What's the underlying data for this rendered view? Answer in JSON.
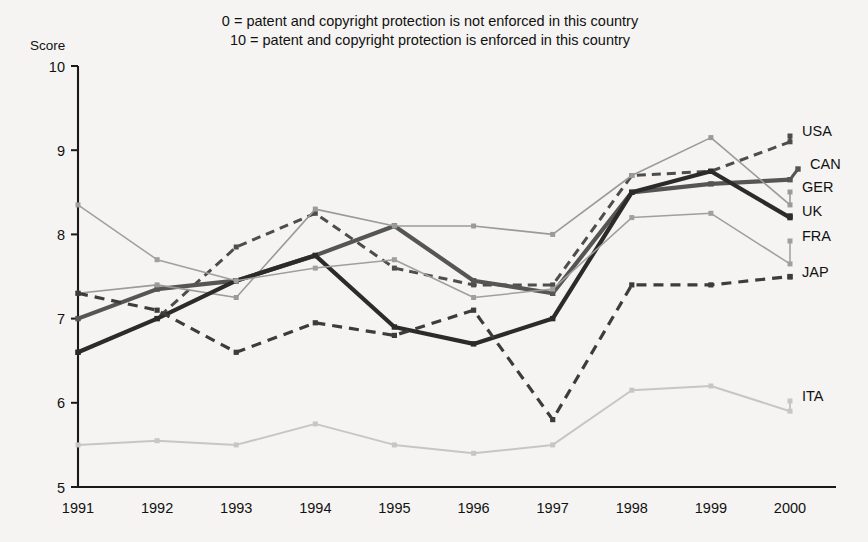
{
  "chart_data": {
    "type": "line",
    "title": "",
    "subtitle_lines": [
      "0 = patent and copyright protection is not enforced in this country",
      "10 = patent and copyright protection is enforced in this country"
    ],
    "ylabel": "Score",
    "xlabel": "",
    "ylim": [
      5,
      10
    ],
    "yticks": [
      "5",
      "6",
      "7",
      "8",
      "9",
      "10"
    ],
    "grid": false,
    "legend_position": "right",
    "categories": [
      "1991",
      "1992",
      "1993",
      "1994",
      "1995",
      "1996",
      "1997",
      "1998",
      "1999",
      "2000"
    ],
    "series": [
      {
        "name": "USA",
        "color": "#4d4d4d",
        "style": "dashed-square",
        "values": [
          6.6,
          7.0,
          7.85,
          8.25,
          7.6,
          7.4,
          7.4,
          8.7,
          8.75,
          9.1
        ]
      },
      {
        "name": "CAN",
        "color": "#555555",
        "style": "solid-thick",
        "values": [
          7.0,
          7.35,
          7.45,
          7.75,
          8.1,
          7.45,
          7.3,
          8.5,
          8.6,
          8.65
        ]
      },
      {
        "name": "GER",
        "color": "#9a9a9a",
        "style": "solid-thin",
        "values": [
          7.3,
          7.4,
          7.25,
          8.3,
          8.1,
          8.1,
          8.0,
          8.7,
          9.15,
          8.35
        ]
      },
      {
        "name": "UK",
        "color": "#2b2b2b",
        "style": "solid-thick-dark",
        "values": [
          6.6,
          7.0,
          7.45,
          7.75,
          6.9,
          6.7,
          7.0,
          8.5,
          8.75,
          8.2
        ]
      },
      {
        "name": "FRA",
        "color": "#9f9f9f",
        "style": "solid-thin-light",
        "values": [
          8.35,
          7.7,
          7.45,
          7.6,
          7.7,
          7.25,
          7.35,
          8.2,
          8.25,
          7.65
        ]
      },
      {
        "name": "JAP",
        "color": "#3c3c3c",
        "style": "dashed-bold",
        "values": [
          7.3,
          7.1,
          6.6,
          6.95,
          6.8,
          7.1,
          5.8,
          7.4,
          7.4,
          7.5
        ]
      },
      {
        "name": "ITA",
        "color": "#c6c6c6",
        "style": "solid-thin-lightest",
        "values": [
          5.5,
          5.55,
          5.5,
          5.75,
          5.5,
          5.4,
          5.5,
          6.15,
          6.2,
          5.9
        ]
      }
    ]
  },
  "legend": [
    {
      "label": "USA",
      "x": 802,
      "y": 131
    },
    {
      "label": "CAN",
      "x": 810,
      "y": 164
    },
    {
      "label": "GER",
      "x": 802,
      "y": 187
    },
    {
      "label": "UK",
      "x": 802,
      "y": 211
    },
    {
      "label": "FRA",
      "x": 802,
      "y": 236
    },
    {
      "label": "JAP",
      "x": 802,
      "y": 272
    },
    {
      "label": "ITA",
      "x": 802,
      "y": 396
    }
  ]
}
